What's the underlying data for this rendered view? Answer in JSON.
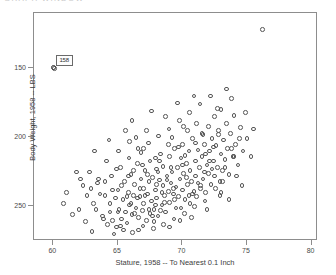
{
  "window": {
    "top_strip_text": "GRAPH WINDOW"
  },
  "axes": {
    "x_title": "Stature, 1958 -- To Nearest 0.1 Inch",
    "y_title": "Body Weight, 1958 -- LBS",
    "x_ticks": [
      "60",
      "65",
      "70",
      "75",
      "80"
    ],
    "y_ticks": [
      "250",
      "200",
      "150"
    ]
  },
  "annotation": {
    "label": "158"
  },
  "chart_data": {
    "type": "scatter",
    "title": "",
    "xlabel": "Stature, 1958 -- To Nearest 0.1 Inch",
    "ylabel": "Body Weight, 1958 -- LBS",
    "xlim": [
      58.5,
      80.5
    ],
    "ylim": [
      125,
      290
    ],
    "xticks": [
      60,
      65,
      70,
      75,
      80
    ],
    "yticks": [
      150,
      200,
      250
    ],
    "grid": false,
    "legend": null,
    "marker": "open-circle",
    "marker_color": "#555555",
    "annotated_point": {
      "label": "158",
      "x": 60.1,
      "y": 250.0
    },
    "points": [
      [
        60.1,
        250.0
      ],
      [
        76.2,
        278.0
      ],
      [
        73.8,
        228.0
      ],
      [
        62.0,
        148.0
      ],
      [
        62.5,
        139.0
      ],
      [
        63.1,
        152.0
      ],
      [
        63.4,
        167.0
      ],
      [
        63.8,
        143.0
      ],
      [
        64.0,
        158.0
      ],
      [
        64.2,
        137.0
      ],
      [
        64.4,
        146.0
      ],
      [
        64.5,
        172.0
      ],
      [
        64.6,
        140.0
      ],
      [
        64.8,
        156.0
      ],
      [
        64.9,
        135.0
      ],
      [
        65.0,
        162.0
      ],
      [
        65.1,
        148.0
      ],
      [
        65.2,
        178.0
      ],
      [
        65.3,
        141.0
      ],
      [
        65.4,
        155.0
      ],
      [
        65.5,
        168.0
      ],
      [
        65.6,
        146.0
      ],
      [
        65.7,
        138.0
      ],
      [
        65.8,
        160.0
      ],
      [
        65.9,
        151.0
      ],
      [
        66.0,
        173.0
      ],
      [
        66.1,
        144.0
      ],
      [
        66.2,
        158.0
      ],
      [
        66.3,
        166.0
      ],
      [
        66.4,
        149.0
      ],
      [
        66.5,
        181.0
      ],
      [
        66.6,
        142.0
      ],
      [
        66.7,
        157.0
      ],
      [
        66.8,
        170.0
      ],
      [
        66.9,
        147.0
      ],
      [
        67.0,
        163.0
      ],
      [
        67.0,
        152.0
      ],
      [
        67.1,
        176.0
      ],
      [
        67.2,
        140.0
      ],
      [
        67.3,
        159.0
      ],
      [
        67.4,
        168.0
      ],
      [
        67.5,
        145.0
      ],
      [
        67.5,
        183.0
      ],
      [
        67.6,
        154.0
      ],
      [
        67.7,
        171.0
      ],
      [
        67.8,
        148.0
      ],
      [
        67.9,
        162.0
      ],
      [
        68.0,
        177.0
      ],
      [
        68.0,
        156.0
      ],
      [
        68.1,
        143.0
      ],
      [
        68.2,
        169.0
      ],
      [
        68.3,
        188.0
      ],
      [
        68.4,
        151.0
      ],
      [
        68.5,
        165.0
      ],
      [
        68.5,
        179.0
      ],
      [
        68.6,
        158.0
      ],
      [
        68.7,
        146.0
      ],
      [
        68.8,
        172.0
      ],
      [
        68.9,
        161.0
      ],
      [
        69.0,
        186.0
      ],
      [
        69.0,
        153.0
      ],
      [
        69.1,
        167.0
      ],
      [
        69.2,
        175.0
      ],
      [
        69.3,
        159.0
      ],
      [
        69.4,
        192.0
      ],
      [
        69.5,
        164.0
      ],
      [
        69.5,
        149.0
      ],
      [
        69.6,
        178.0
      ],
      [
        69.7,
        157.0
      ],
      [
        69.8,
        170.0
      ],
      [
        69.9,
        185.0
      ],
      [
        70.0,
        162.0
      ],
      [
        70.0,
        195.0
      ],
      [
        70.1,
        174.0
      ],
      [
        70.2,
        155.0
      ],
      [
        70.3,
        181.0
      ],
      [
        70.4,
        166.0
      ],
      [
        70.5,
        190.0
      ],
      [
        70.5,
        158.0
      ],
      [
        70.6,
        176.0
      ],
      [
        70.7,
        168.0
      ],
      [
        70.8,
        199.0
      ],
      [
        70.9,
        161.0
      ],
      [
        71.0,
        183.0
      ],
      [
        71.0,
        172.0
      ],
      [
        71.1,
        157.0
      ],
      [
        71.2,
        191.0
      ],
      [
        71.3,
        178.0
      ],
      [
        71.4,
        165.0
      ],
      [
        71.5,
        203.0
      ],
      [
        71.5,
        186.0
      ],
      [
        71.6,
        170.0
      ],
      [
        71.7,
        195.0
      ],
      [
        71.8,
        160.0
      ],
      [
        71.9,
        180.0
      ],
      [
        72.0,
        208.0
      ],
      [
        72.0,
        174.0
      ],
      [
        72.1,
        190.0
      ],
      [
        72.2,
        166.0
      ],
      [
        72.3,
        199.0
      ],
      [
        72.4,
        183.0
      ],
      [
        72.5,
        215.0
      ],
      [
        72.5,
        172.0
      ],
      [
        72.6,
        194.0
      ],
      [
        72.7,
        178.0
      ],
      [
        72.8,
        205.0
      ],
      [
        72.9,
        168.0
      ],
      [
        73.0,
        188.0
      ],
      [
        73.0,
        220.0
      ],
      [
        73.1,
        176.0
      ],
      [
        73.2,
        198.0
      ],
      [
        73.3,
        184.0
      ],
      [
        73.4,
        210.0
      ],
      [
        73.5,
        192.0
      ],
      [
        73.6,
        173.0
      ],
      [
        73.7,
        203.0
      ],
      [
        73.9,
        186.0
      ],
      [
        74.0,
        216.0
      ],
      [
        74.1,
        195.0
      ],
      [
        74.3,
        180.0
      ],
      [
        74.5,
        207.0
      ],
      [
        74.7,
        190.0
      ],
      [
        75.0,
        199.0
      ],
      [
        75.3,
        186.0
      ],
      [
        61.0,
        160.0
      ],
      [
        61.5,
        144.0
      ],
      [
        62.8,
        175.0
      ],
      [
        63.0,
        132.0
      ],
      [
        63.6,
        159.0
      ],
      [
        64.1,
        183.0
      ],
      [
        64.7,
        130.0
      ],
      [
        65.05,
        190.0
      ],
      [
        65.45,
        133.0
      ],
      [
        65.85,
        185.0
      ],
      [
        66.15,
        131.0
      ],
      [
        66.55,
        192.0
      ],
      [
        66.95,
        136.0
      ],
      [
        67.35,
        196.0
      ],
      [
        67.75,
        134.0
      ],
      [
        68.15,
        201.0
      ],
      [
        68.55,
        137.0
      ],
      [
        68.95,
        206.0
      ],
      [
        69.35,
        141.0
      ],
      [
        69.75,
        212.0
      ],
      [
        70.15,
        145.0
      ],
      [
        70.55,
        218.0
      ],
      [
        70.95,
        150.0
      ],
      [
        71.35,
        224.0
      ],
      [
        71.75,
        154.0
      ],
      [
        72.15,
        230.0
      ],
      [
        72.55,
        163.0
      ],
      [
        68.3,
        147.0
      ],
      [
        67.9,
        185.0
      ],
      [
        66.8,
        189.0
      ],
      [
        65.9,
        197.0
      ],
      [
        69.2,
        200.0
      ],
      [
        70.4,
        205.0
      ],
      [
        71.1,
        210.0
      ],
      [
        68.7,
        215.0
      ],
      [
        67.2,
        205.0
      ],
      [
        66.4,
        200.0
      ],
      [
        69.6,
        225.0
      ],
      [
        70.9,
        230.0
      ],
      [
        72.7,
        221.0
      ],
      [
        73.4,
        235.0
      ],
      [
        74.9,
        218.0
      ],
      [
        64.3,
        198.0
      ],
      [
        65.6,
        205.0
      ],
      [
        63.2,
        190.0
      ],
      [
        62.3,
        165.0
      ],
      [
        61.8,
        175.0
      ],
      [
        66.1,
        212.0
      ],
      [
        67.6,
        219.0
      ],
      [
        68.9,
        195.0
      ],
      [
        70.2,
        187.0
      ],
      [
        71.6,
        202.0
      ],
      [
        72.3,
        177.0
      ],
      [
        73.1,
        168.0
      ],
      [
        74.2,
        172.0
      ],
      [
        65.2,
        136.0
      ],
      [
        66.6,
        133.0
      ],
      [
        67.8,
        139.0
      ],
      [
        69.0,
        135.0
      ],
      [
        70.7,
        142.0
      ],
      [
        63.9,
        141.0
      ],
      [
        64.9,
        177.0
      ],
      [
        66.0,
        152.0
      ],
      [
        67.4,
        148.0
      ],
      [
        68.6,
        153.0
      ],
      [
        69.9,
        149.0
      ],
      [
        71.4,
        163.0
      ],
      [
        72.9,
        158.0
      ],
      [
        66.7,
        163.0
      ],
      [
        67.1,
        158.0
      ],
      [
        68.4,
        160.0
      ],
      [
        69.4,
        155.0
      ],
      [
        70.6,
        152.0
      ],
      [
        65.7,
        157.0
      ],
      [
        64.6,
        162.0
      ],
      [
        63.5,
        170.0
      ],
      [
        66.3,
        145.0
      ],
      [
        67.7,
        143.0
      ],
      [
        69.8,
        140.0
      ],
      [
        71.9,
        148.0
      ],
      [
        73.6,
        155.0
      ],
      [
        74.6,
        165.0
      ],
      [
        60.8,
        152.0
      ],
      [
        62.6,
        158.0
      ],
      [
        68.2,
        183.0
      ],
      [
        69.1,
        178.0
      ],
      [
        70.3,
        171.0
      ],
      [
        71.2,
        167.0
      ],
      [
        72.4,
        193.0
      ],
      [
        67.0,
        192.0
      ],
      [
        66.9,
        180.0
      ],
      [
        65.8,
        172.0
      ],
      [
        68.8,
        169.0
      ],
      [
        70.0,
        180.0
      ],
      [
        71.8,
        188.0
      ],
      [
        73.3,
        178.0
      ],
      [
        64.4,
        152.0
      ],
      [
        65.3,
        165.0
      ],
      [
        62.1,
        170.0
      ],
      [
        69.3,
        163.0
      ],
      [
        70.8,
        159.0
      ],
      [
        68.0,
        166.0
      ],
      [
        67.3,
        173.0
      ],
      [
        66.2,
        176.0
      ],
      [
        72.1,
        183.0
      ],
      [
        73.8,
        192.0
      ],
      [
        75.5,
        206.0
      ],
      [
        65.0,
        146.0
      ],
      [
        64.0,
        168.0
      ],
      [
        71.0,
        196.0
      ],
      [
        72.8,
        202.0
      ],
      [
        74.4,
        199.0
      ],
      [
        63.3,
        148.0
      ],
      [
        62.9,
        163.0
      ],
      [
        69.7,
        193.0
      ],
      [
        70.1,
        208.0
      ],
      [
        66.5,
        156.0
      ],
      [
        67.9,
        151.0
      ],
      [
        68.1,
        175.0
      ],
      [
        71.7,
        175.0
      ],
      [
        73.0,
        160.0
      ],
      [
        74.0,
        186.0
      ]
    ]
  }
}
